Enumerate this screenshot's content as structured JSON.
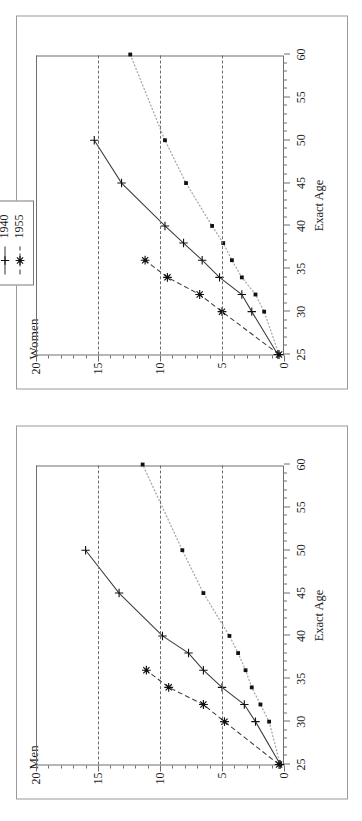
{
  "figure": {
    "xlabel": "Exact Age",
    "x_major_ticks": [
      25,
      30,
      35,
      40,
      45,
      50,
      55,
      60
    ],
    "y_major_ticks": [
      0,
      5,
      10,
      15,
      20
    ],
    "xlim": [
      25,
      60
    ],
    "ylim": [
      0,
      20
    ]
  },
  "legend": {
    "title": "Year of Birth",
    "entries": [
      {
        "label": "1925",
        "style": "dotted",
        "marker": "square-dot",
        "color": "#2b2b2b"
      },
      {
        "label": "1940",
        "style": "solid",
        "marker": "plus",
        "color": "#2b2b2b"
      },
      {
        "label": "1955",
        "style": "dashed",
        "marker": "star",
        "color": "#2b2b2b"
      }
    ]
  },
  "panels": [
    {
      "key": "men",
      "title": "Men"
    },
    {
      "key": "women",
      "title": "Women"
    }
  ],
  "chart_data": {
    "type": "line",
    "title": "",
    "xlabel": "Exact Age",
    "ylabel": "",
    "xlim": [
      25,
      60
    ],
    "ylim": [
      0,
      20
    ],
    "grid": "horizontal-dashed at 5, 10, 15",
    "legend_title": "Year of Birth",
    "legend_position": "top-right outside plot",
    "panels": [
      {
        "name": "Men",
        "series": [
          {
            "name": "1925",
            "style": "dotted",
            "marker": "square-dot",
            "points": [
              {
                "x": 25,
                "y": 0.3
              },
              {
                "x": 30,
                "y": 1.2
              },
              {
                "x": 32,
                "y": 1.9
              },
              {
                "x": 34,
                "y": 2.6
              },
              {
                "x": 36,
                "y": 3.1
              },
              {
                "x": 38,
                "y": 3.7
              },
              {
                "x": 40,
                "y": 4.4
              },
              {
                "x": 45,
                "y": 6.5
              },
              {
                "x": 50,
                "y": 8.2
              },
              {
                "x": 60,
                "y": 11.4
              }
            ]
          },
          {
            "name": "1940",
            "style": "solid",
            "marker": "plus",
            "points": [
              {
                "x": 25,
                "y": 0.3
              },
              {
                "x": 30,
                "y": 2.3
              },
              {
                "x": 32,
                "y": 3.2
              },
              {
                "x": 34,
                "y": 5.0
              },
              {
                "x": 36,
                "y": 6.5
              },
              {
                "x": 38,
                "y": 7.7
              },
              {
                "x": 40,
                "y": 9.8
              },
              {
                "x": 45,
                "y": 13.3
              },
              {
                "x": 50,
                "y": 16.0
              }
            ]
          },
          {
            "name": "1955",
            "style": "dashed",
            "marker": "star",
            "points": [
              {
                "x": 25,
                "y": 0.4
              },
              {
                "x": 30,
                "y": 4.8
              },
              {
                "x": 32,
                "y": 6.5
              },
              {
                "x": 34,
                "y": 9.3
              },
              {
                "x": 36,
                "y": 11.1
              }
            ]
          }
        ]
      },
      {
        "name": "Women",
        "series": [
          {
            "name": "1925",
            "style": "dotted",
            "marker": "square-dot",
            "points": [
              {
                "x": 25,
                "y": 0.4
              },
              {
                "x": 30,
                "y": 1.6
              },
              {
                "x": 32,
                "y": 2.3
              },
              {
                "x": 34,
                "y": 3.4
              },
              {
                "x": 36,
                "y": 4.2
              },
              {
                "x": 38,
                "y": 4.9
              },
              {
                "x": 40,
                "y": 5.8
              },
              {
                "x": 45,
                "y": 7.9
              },
              {
                "x": 50,
                "y": 9.6
              },
              {
                "x": 60,
                "y": 12.4
              }
            ]
          },
          {
            "name": "1940",
            "style": "solid",
            "marker": "plus",
            "points": [
              {
                "x": 25,
                "y": 0.5
              },
              {
                "x": 30,
                "y": 2.6
              },
              {
                "x": 32,
                "y": 3.4
              },
              {
                "x": 34,
                "y": 5.2
              },
              {
                "x": 36,
                "y": 6.6
              },
              {
                "x": 38,
                "y": 8.1
              },
              {
                "x": 40,
                "y": 9.6
              },
              {
                "x": 45,
                "y": 13.1
              },
              {
                "x": 50,
                "y": 15.3
              }
            ]
          },
          {
            "name": "1955",
            "style": "dashed",
            "marker": "star",
            "points": [
              {
                "x": 25,
                "y": 0.4
              },
              {
                "x": 30,
                "y": 5.0
              },
              {
                "x": 32,
                "y": 6.8
              },
              {
                "x": 34,
                "y": 9.4
              },
              {
                "x": 36,
                "y": 11.2
              }
            ]
          }
        ]
      }
    ]
  }
}
